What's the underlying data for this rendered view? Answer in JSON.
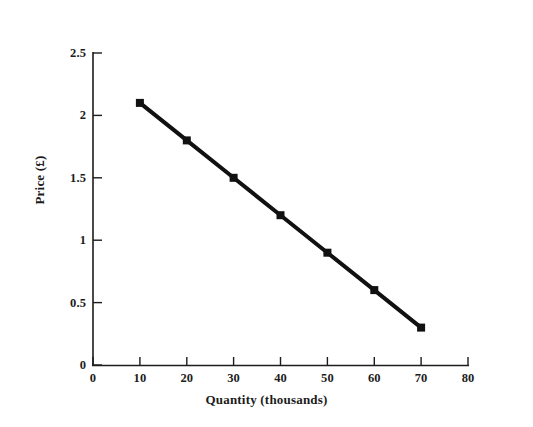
{
  "chart_data": {
    "type": "line",
    "title": "",
    "subtitle": "",
    "xlabel": "Quantity (thousands)",
    "ylabel": "Price (£)",
    "xlim": [
      0,
      80
    ],
    "ylim": [
      0,
      2.5
    ],
    "xticks": [
      "0",
      "10",
      "20",
      "30",
      "40",
      "50",
      "60",
      "70",
      "80"
    ],
    "yticks": [
      "0",
      "0.5",
      "1",
      "1.5",
      "2",
      "2.5"
    ],
    "xtick_values": [
      0,
      10,
      20,
      30,
      40,
      50,
      60,
      70,
      80
    ],
    "ytick_values": [
      0,
      0.5,
      1,
      1.5,
      2,
      2.5
    ],
    "grid": false,
    "legend": null,
    "legend_position": "none",
    "annotations": [],
    "x": [
      10,
      20,
      30,
      40,
      50,
      60,
      70
    ],
    "series": [
      {
        "name": "Demand",
        "values": [
          2.1,
          1.8,
          1.5,
          1.2,
          0.9,
          0.6,
          0.3
        ],
        "color": "#111111",
        "marker": "square",
        "marker_color": "#111111",
        "line_width": 4
      }
    ]
  },
  "figure": {
    "background_color": "#ffffff",
    "axis_color": "#1c1c1c",
    "ink_color": "#111111",
    "tick_direction": "inward"
  }
}
